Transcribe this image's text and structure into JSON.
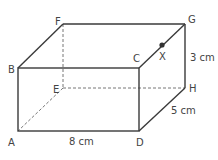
{
  "figure": {
    "type": "cuboid",
    "vertices": {
      "A": "A",
      "B": "B",
      "C": "C",
      "D": "D",
      "E": "E",
      "F": "F",
      "G": "G",
      "H": "H"
    },
    "point": "X",
    "dimensions": {
      "length": "8 cm",
      "width": "5 cm",
      "height": "3 cm"
    },
    "colors": {
      "edge": "#3a3a3a",
      "hidden": "#777777",
      "text": "#444444"
    }
  }
}
